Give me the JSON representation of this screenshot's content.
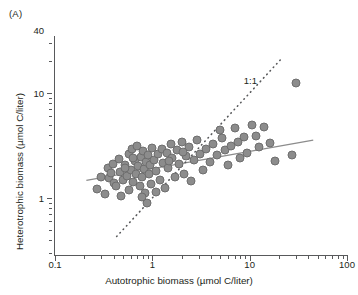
{
  "figure": {
    "panel_label": "(A)",
    "annotation": "1:1"
  },
  "chart_data": {
    "type": "scatter",
    "title": "(A)",
    "xlabel": "Autotrophic biomass (µmol C/liter)",
    "ylabel": "Heterotrophic biomass (µmol C/liter)",
    "xscale": "log",
    "yscale": "log",
    "xlim": [
      0.1,
      100
    ],
    "ylim": [
      0.4,
      40
    ],
    "grid": false,
    "legend": null,
    "xticks": [
      0.1,
      1,
      10,
      100
    ],
    "xticklabels": [
      "0.1",
      "1",
      "10",
      "100"
    ],
    "yticks": [
      1,
      10,
      40
    ],
    "yticklabels": [
      "1",
      "10",
      "40"
    ],
    "marker_color": "#8c8c8c",
    "marker_edge_color": "#6e6e6e",
    "line_color": "#8c8c8c",
    "annotations": [
      {
        "text": "1:1",
        "x": 10.5,
        "y": 13.0
      }
    ],
    "series": [
      {
        "name": "Regression fit",
        "type": "line",
        "style": "solid",
        "color": "#8c8c8c",
        "x": [
          0.21,
          45.0
        ],
        "y": [
          1.47,
          3.55
        ]
      },
      {
        "name": "1:1 line",
        "type": "line",
        "style": "dotted",
        "color": "#58595b",
        "x": [
          0.43,
          22.0
        ],
        "y": [
          0.43,
          22.0
        ]
      },
      {
        "name": "Samples",
        "type": "scatter",
        "points": [
          [
            0.27,
            1.23
          ],
          [
            0.3,
            1.6
          ],
          [
            0.33,
            1.08
          ],
          [
            0.35,
            1.95
          ],
          [
            0.36,
            1.55
          ],
          [
            0.38,
            1.72
          ],
          [
            0.39,
            2.12
          ],
          [
            0.4,
            1.4
          ],
          [
            0.42,
            1.3
          ],
          [
            0.45,
            2.35
          ],
          [
            0.46,
            1.78
          ],
          [
            0.48,
            1.05
          ],
          [
            0.5,
            1.48
          ],
          [
            0.52,
            2.05
          ],
          [
            0.55,
            1.62
          ],
          [
            0.57,
            2.62
          ],
          [
            0.58,
            1.2
          ],
          [
            0.6,
            1.85
          ],
          [
            0.62,
            2.9
          ],
          [
            0.64,
            1.42
          ],
          [
            0.66,
            2.25
          ],
          [
            0.68,
            1.7
          ],
          [
            0.7,
            3.1
          ],
          [
            0.72,
            2.0
          ],
          [
            0.74,
            1.3
          ],
          [
            0.76,
            2.45
          ],
          [
            0.78,
            1.58
          ],
          [
            0.8,
            2.78
          ],
          [
            0.82,
            1.9
          ],
          [
            0.84,
            1.12
          ],
          [
            0.86,
            2.2
          ],
          [
            0.88,
            0.9
          ],
          [
            0.9,
            2.55
          ],
          [
            0.92,
            1.68
          ],
          [
            0.95,
            2.08
          ],
          [
            0.98,
            1.35
          ],
          [
            1.0,
            3.0
          ],
          [
            1.05,
            2.3
          ],
          [
            1.1,
            1.8
          ],
          [
            1.15,
            2.6
          ],
          [
            1.2,
            1.5
          ],
          [
            1.25,
            2.95
          ],
          [
            1.3,
            2.15
          ],
          [
            1.35,
            1.25
          ],
          [
            1.4,
            2.7
          ],
          [
            1.45,
            1.95
          ],
          [
            1.55,
            3.25
          ],
          [
            1.6,
            2.4
          ],
          [
            1.7,
            1.6
          ],
          [
            1.8,
            2.85
          ],
          [
            1.9,
            2.1
          ],
          [
            2.0,
            3.4
          ],
          [
            2.1,
            1.7
          ],
          [
            2.2,
            2.5
          ],
          [
            2.4,
            3.05
          ],
          [
            2.5,
            1.45
          ],
          [
            2.7,
            2.3
          ],
          [
            2.9,
            3.6
          ],
          [
            3.1,
            2.65
          ],
          [
            3.3,
            1.85
          ],
          [
            3.6,
            2.95
          ],
          [
            3.9,
            2.2
          ],
          [
            4.2,
            3.3
          ],
          [
            4.6,
            2.55
          ],
          [
            5.0,
            4.4
          ],
          [
            5.2,
            3.7
          ],
          [
            5.6,
            2.85
          ],
          [
            6.0,
            2.05
          ],
          [
            6.5,
            3.15
          ],
          [
            7.0,
            4.6
          ],
          [
            7.5,
            3.45
          ],
          [
            8.0,
            2.4
          ],
          [
            8.8,
            3.8
          ],
          [
            9.5,
            2.7
          ],
          [
            10.5,
            5.0
          ],
          [
            11.5,
            3.9
          ],
          [
            12.5,
            3.05
          ],
          [
            14.0,
            4.7
          ],
          [
            16.0,
            3.35
          ],
          [
            18.0,
            2.25
          ],
          [
            30.0,
            12.5
          ],
          [
            27.0,
            2.55
          ],
          [
            0.79,
            1.02
          ],
          [
            1.08,
            1.15
          ],
          [
            0.53,
            1.92
          ],
          [
            2.05,
            2.75
          ],
          [
            0.63,
            2.42
          ],
          [
            1.48,
            2.25
          ]
        ]
      }
    ]
  }
}
